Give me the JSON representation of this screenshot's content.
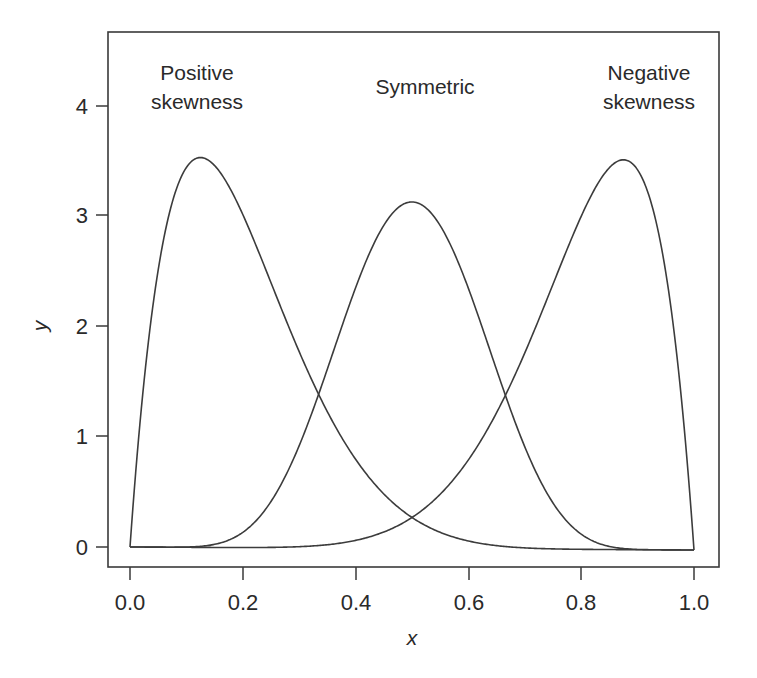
{
  "chart_data": {
    "type": "line",
    "title": "",
    "xlabel": "x",
    "ylabel": "y",
    "xlim": [
      0.0,
      1.0
    ],
    "ylim": [
      0,
      4
    ],
    "grid": false,
    "legend": null,
    "x_ticks": [
      "0.0",
      "0.2",
      "0.4",
      "0.6",
      "0.8",
      "1.0"
    ],
    "y_ticks": [
      "0",
      "1",
      "2",
      "3",
      "4"
    ],
    "annotations": [
      {
        "id": "positive",
        "lines": [
          "Positive",
          "skewness"
        ],
        "near_x": 0.13
      },
      {
        "id": "symmetric",
        "lines": [
          "Symmetric"
        ],
        "near_x": 0.5
      },
      {
        "id": "negative",
        "lines": [
          "Negative",
          "skewness"
        ],
        "near_x": 0.88
      }
    ],
    "series": [
      {
        "name": "Positive skewness",
        "distribution": "Beta(2, 8)",
        "alpha": 2,
        "beta": 8,
        "peak": {
          "x": 0.125,
          "y": 3.52
        },
        "x": [
          0.0,
          0.05,
          0.1,
          0.125,
          0.15,
          0.2,
          0.3,
          0.4,
          0.5,
          0.6,
          0.7,
          0.8,
          0.9,
          1.0
        ],
        "values": [
          0.0,
          2.5,
          3.44,
          3.52,
          3.49,
          3.02,
          1.77,
          0.81,
          0.28,
          0.07,
          0.01,
          0.0,
          0.0,
          0.0
        ]
      },
      {
        "name": "Symmetric",
        "distribution": "Beta(8, 8)",
        "alpha": 8,
        "beta": 8,
        "peak": {
          "x": 0.5,
          "y": 3.49
        },
        "x": [
          0.0,
          0.1,
          0.2,
          0.3,
          0.35,
          0.4,
          0.5,
          0.6,
          0.65,
          0.7,
          0.8,
          0.9,
          1.0
        ],
        "values": [
          0.0,
          0.0,
          0.13,
          1.11,
          1.89,
          2.75,
          3.49,
          2.75,
          1.89,
          1.11,
          0.13,
          0.0,
          0.0
        ]
      },
      {
        "name": "Negative skewness",
        "distribution": "Beta(8, 2)",
        "alpha": 8,
        "beta": 2,
        "peak": {
          "x": 0.875,
          "y": 3.52
        },
        "x": [
          0.0,
          0.1,
          0.2,
          0.3,
          0.4,
          0.5,
          0.6,
          0.7,
          0.8,
          0.85,
          0.875,
          0.9,
          0.95,
          1.0
        ],
        "values": [
          0.0,
          0.0,
          0.0,
          0.01,
          0.07,
          0.28,
          0.81,
          1.77,
          3.02,
          3.49,
          3.52,
          3.44,
          2.5,
          0.0
        ]
      }
    ],
    "crossings": [
      {
        "x": 0.35,
        "y": 1.33,
        "between": [
          "Positive skewness",
          "Symmetric"
        ]
      },
      {
        "x": 0.65,
        "y": 1.33,
        "between": [
          "Symmetric",
          "Negative skewness"
        ]
      },
      {
        "x": 0.5,
        "y": 0.28,
        "between": [
          "Positive skewness",
          "Negative skewness"
        ]
      }
    ]
  },
  "labels": {
    "positive_line1": "Positive",
    "positive_line2": "skewness",
    "symmetric": "Symmetric",
    "negative_line1": "Negative",
    "negative_line2": "skewness",
    "xlabel": "x",
    "ylabel": "y",
    "xticks": [
      "0.0",
      "0.2",
      "0.4",
      "0.6",
      "0.8",
      "1.0"
    ],
    "yticks": [
      "0",
      "1",
      "2",
      "3",
      "4"
    ]
  },
  "colors": {
    "line": "#3c3c3c",
    "frame": "#3a3a3a",
    "text": "#2a2a2a",
    "background": "#ffffff"
  }
}
